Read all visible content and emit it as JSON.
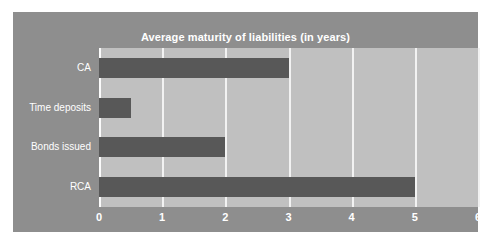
{
  "chart_data": {
    "type": "bar",
    "orientation": "horizontal",
    "title": "Average maturity of liabilities (in years)",
    "xlabel": "",
    "ylabel": "",
    "categories": [
      "CA",
      "Time deposits",
      "Bonds issued",
      "RCA"
    ],
    "values": [
      3,
      0.5,
      2,
      5
    ],
    "series": [
      {
        "name": "Average maturity",
        "values": [
          3,
          0.5,
          2,
          5
        ]
      }
    ],
    "xlim": [
      0,
      6
    ],
    "xticks": [
      0,
      1,
      2,
      3,
      4,
      5,
      6
    ],
    "xtick_labels": [
      "0",
      "1",
      "2",
      "3",
      "4",
      "5",
      "6"
    ],
    "grid": true,
    "legend": false,
    "colors": {
      "bar": "#585858",
      "plot_background": "#c0c0c0",
      "card_background": "#8e8e8e",
      "gridline": "#f2f2f2",
      "text": "#ffffff",
      "page_background": "#ffffff"
    }
  }
}
